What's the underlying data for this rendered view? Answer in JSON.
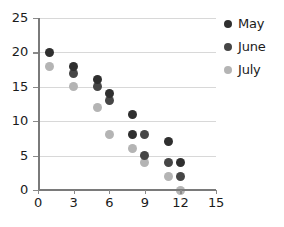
{
  "chart_data": {
    "type": "scatter",
    "title": "",
    "xlabel": "",
    "ylabel": "",
    "xlim": [
      0,
      15
    ],
    "ylim": [
      0,
      25
    ],
    "xticks": [
      0,
      3,
      6,
      9,
      12,
      15
    ],
    "yticks": [
      0,
      5,
      10,
      15,
      20,
      25
    ],
    "grid": "horizontal",
    "legend_position": "right",
    "series": [
      {
        "name": "May",
        "color": "#2f2f2f",
        "points": [
          {
            "x": 1,
            "y": 20
          },
          {
            "x": 3,
            "y": 18
          },
          {
            "x": 5,
            "y": 16
          },
          {
            "x": 6,
            "y": 14
          },
          {
            "x": 8,
            "y": 11
          },
          {
            "x": 8,
            "y": 8
          },
          {
            "x": 11,
            "y": 7
          },
          {
            "x": 12,
            "y": 4
          }
        ]
      },
      {
        "name": "June",
        "color": "#464646",
        "points": [
          {
            "x": 3,
            "y": 17
          },
          {
            "x": 5,
            "y": 15
          },
          {
            "x": 6,
            "y": 13
          },
          {
            "x": 9,
            "y": 8
          },
          {
            "x": 9,
            "y": 5
          },
          {
            "x": 11,
            "y": 4
          },
          {
            "x": 12,
            "y": 2
          }
        ]
      },
      {
        "name": "July",
        "color": "#b4b4b4",
        "points": [
          {
            "x": 1,
            "y": 18
          },
          {
            "x": 3,
            "y": 15
          },
          {
            "x": 5,
            "y": 12
          },
          {
            "x": 6,
            "y": 8
          },
          {
            "x": 8,
            "y": 6
          },
          {
            "x": 9,
            "y": 4
          },
          {
            "x": 11,
            "y": 2
          },
          {
            "x": 12,
            "y": 0
          }
        ]
      }
    ]
  },
  "axis": {
    "x_tick_labels": [
      "0",
      "3",
      "6",
      "9",
      "12",
      "15"
    ],
    "y_tick_labels": [
      "0",
      "5",
      "10",
      "15",
      "20",
      "25"
    ]
  },
  "legend": {
    "items": [
      {
        "label": "May"
      },
      {
        "label": "June"
      },
      {
        "label": "July"
      }
    ]
  }
}
